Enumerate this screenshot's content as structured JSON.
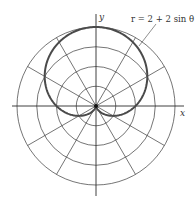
{
  "chart_data": {
    "type": "line",
    "coordinate_system": "polar",
    "title": "",
    "equation": "r = 2 + 2 sin θ",
    "annotation": "r = 2 + 2 sin θ",
    "xlabel": "x",
    "ylabel": "y",
    "radial_grid": [
      1,
      2,
      3,
      4
    ],
    "angular_grid_deg": [
      0,
      30,
      60,
      90,
      120,
      150,
      180,
      210,
      240,
      270,
      300,
      330
    ],
    "rlim": [
      0,
      4
    ],
    "grid": true,
    "legend": "none",
    "series": [
      {
        "name": "r = 2 + 2 sin θ",
        "theta_deg": [
          0,
          30,
          60,
          90,
          120,
          150,
          180,
          210,
          240,
          270,
          300,
          330,
          360
        ],
        "r": [
          2,
          3,
          3.732,
          4,
          3.732,
          3,
          2,
          1,
          0.268,
          0,
          0.268,
          1,
          2
        ]
      }
    ]
  },
  "labels": {
    "x_axis": "x",
    "y_axis": "y",
    "equation": "r = 2 + 2 sin θ"
  }
}
